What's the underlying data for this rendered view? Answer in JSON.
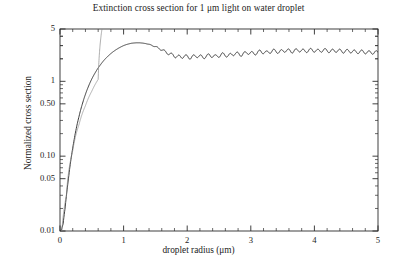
{
  "chart_data": {
    "type": "line",
    "title": "Extinction cross section for 1 μm light on water droplet",
    "xlabel": "droplet radius (μm)",
    "ylabel": "Normalized cross section",
    "xlim": [
      0,
      5
    ],
    "ylim": [
      0.01,
      5
    ],
    "yscale": "log",
    "xscale": "linear",
    "grid": false,
    "legend": null,
    "xticks": [
      0,
      1,
      2,
      3,
      4,
      5
    ],
    "xtick_labels": [
      "0",
      "1",
      "2",
      "3",
      "4",
      "5"
    ],
    "yticks": [
      0.01,
      0.05,
      0.1,
      0.5,
      1,
      5
    ],
    "ytick_labels": [
      "0.01",
      "0.05",
      "0.10",
      "0.50",
      "1",
      "5"
    ],
    "series": [
      {
        "name": "Mie extinction efficiency",
        "x": [
          0.02,
          0.05,
          0.08,
          0.1,
          0.12,
          0.14,
          0.16,
          0.18,
          0.2,
          0.22,
          0.25,
          0.28,
          0.3,
          0.33,
          0.36,
          0.4,
          0.44,
          0.48,
          0.52,
          0.56,
          0.6,
          0.64,
          0.68,
          0.72,
          0.76,
          0.8,
          0.84,
          0.88,
          0.92,
          0.96,
          1.0,
          1.04,
          1.08,
          1.12,
          1.16,
          1.2,
          1.25,
          1.3,
          1.35,
          1.4,
          1.45,
          1.5,
          1.55,
          1.6,
          1.65,
          1.7,
          1.75,
          1.8,
          1.85,
          1.9,
          1.95,
          2.0,
          2.05,
          2.1,
          2.15,
          2.2,
          2.25,
          2.3,
          2.35,
          2.4,
          2.45,
          2.5,
          2.55,
          2.6,
          2.65,
          2.7,
          2.75,
          2.8,
          2.85,
          2.9,
          2.95,
          3.0,
          3.05,
          3.1,
          3.15,
          3.2,
          3.25,
          3.3,
          3.35,
          3.4,
          3.45,
          3.5,
          3.55,
          3.6,
          3.65,
          3.7,
          3.75,
          3.8,
          3.85,
          3.9,
          3.95,
          4.0,
          4.05,
          4.1,
          4.15,
          4.2,
          4.25,
          4.3,
          4.35,
          4.4,
          4.45,
          4.5,
          4.55,
          4.6,
          4.65,
          4.7,
          4.75,
          4.8,
          4.85,
          4.9,
          4.95,
          5.0
        ],
        "y": [
          0.0102,
          0.0125,
          0.02,
          0.029,
          0.0405,
          0.056,
          0.076,
          0.0995,
          0.128,
          0.161,
          0.221,
          0.29,
          0.342,
          0.43,
          0.526,
          0.67,
          0.825,
          0.99,
          1.16,
          1.33,
          1.51,
          1.68,
          1.86,
          2.03,
          2.19,
          2.35,
          2.5,
          2.64,
          2.77,
          2.89,
          3.0,
          3.09,
          3.16,
          3.22,
          3.25,
          3.27,
          3.27,
          3.24,
          3.19,
          3.11,
          3.02,
          2.9,
          2.77,
          2.64,
          2.5,
          2.37,
          2.27,
          2.2,
          2.13,
          2.12,
          2.17,
          2.13,
          2.08,
          2.14,
          2.2,
          2.15,
          2.1,
          2.16,
          2.23,
          2.19,
          2.14,
          2.21,
          2.29,
          2.25,
          2.2,
          2.28,
          2.36,
          2.32,
          2.27,
          2.35,
          2.43,
          2.39,
          2.34,
          2.42,
          2.5,
          2.46,
          2.41,
          2.49,
          2.56,
          2.52,
          2.47,
          2.54,
          2.6,
          2.56,
          2.51,
          2.57,
          2.62,
          2.58,
          2.53,
          2.58,
          2.62,
          2.59,
          2.54,
          2.58,
          2.61,
          2.58,
          2.53,
          2.56,
          2.58,
          2.55,
          2.51,
          2.53,
          2.54,
          2.51,
          2.47,
          2.48,
          2.49,
          2.46,
          2.43,
          2.43,
          2.44,
          2.42
        ],
        "ripple_amplitude": 0.055,
        "ripple_period_um": 0.115,
        "color": "#3a3a3a",
        "linewidth": 1.0
      },
      {
        "name": "Rayleigh small-particle asymptote",
        "x": [
          0.03,
          0.1,
          0.2,
          0.3,
          0.4,
          0.5,
          0.6,
          0.66
        ],
        "y": [
          0.0102,
          0.0295,
          0.118,
          0.266,
          0.472,
          0.738,
          1.06,
          5.0
        ],
        "color": "#8a8a8a",
        "linewidth": 0.7
      }
    ],
    "annotations": [],
    "plot_area_px": {
      "left": 60,
      "right": 378,
      "top": 29,
      "bottom": 231
    }
  },
  "colors": {
    "axis": "#2b2b2b",
    "curve": "#3a3a3a",
    "asymptote": "#8f8f8f",
    "text": "#222222",
    "background": "#ffffff"
  }
}
